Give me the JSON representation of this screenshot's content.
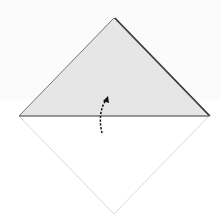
{
  "diagram": {
    "type": "origami-fold-step",
    "colors": {
      "paper_back": "#e6e6e6",
      "paper_front": "#ffffff",
      "edge": "#555555",
      "thin_edge": "#d0d0d0",
      "arrow": "#111111",
      "background": "#ffffff"
    },
    "shapes": {
      "folded_triangle": {
        "points": [
          [
            114,
            18
          ],
          [
            209,
            116
          ],
          [
            19,
            116
          ]
        ]
      },
      "lower_half_outline": {
        "points": [
          [
            19,
            116
          ],
          [
            114,
            214
          ],
          [
            209,
            116
          ]
        ]
      }
    },
    "arrow": {
      "style": "dashed-curved",
      "from": [
        102,
        133
      ],
      "to": [
        108,
        97
      ],
      "direction": "up"
    }
  }
}
